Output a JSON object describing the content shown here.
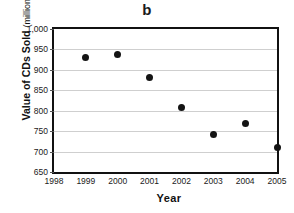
{
  "chart_data": {
    "type": "scatter",
    "title": "b",
    "xlabel": "Year",
    "ylabel": "Value of CDs Sold",
    "ylabel_unit": "(millions)",
    "x": [
      1999,
      2000,
      2001,
      2002,
      2003,
      2004,
      2005
    ],
    "values": [
      931,
      938,
      881,
      808,
      742,
      768,
      710
    ],
    "points": [
      {
        "x": 1999,
        "y": 931
      },
      {
        "x": 2000,
        "y": 938
      },
      {
        "x": 2001,
        "y": 881
      },
      {
        "x": 2002,
        "y": 808
      },
      {
        "x": 2003,
        "y": 742
      },
      {
        "x": 2004,
        "y": 768
      },
      {
        "x": 2005,
        "y": 710
      }
    ],
    "xlim": [
      1998,
      2005
    ],
    "ylim": [
      650,
      1000
    ],
    "xticks": [
      1998,
      1999,
      2000,
      2001,
      2002,
      2003,
      2004,
      2005
    ],
    "xtick_labels": [
      "1998",
      "1999",
      "2000",
      "2001",
      "2002",
      "2003",
      "2004",
      "2005"
    ],
    "yticks": [
      650,
      700,
      750,
      800,
      850,
      900,
      950,
      1000
    ],
    "ytick_labels": [
      "650",
      "700",
      "750",
      "800",
      "850",
      "900",
      "950",
      "1,000"
    ],
    "grid": "horizontal",
    "legend": "none",
    "marker_color": "#141414",
    "gridline_color": "#cfcfcf",
    "axis_color": "#111111"
  }
}
